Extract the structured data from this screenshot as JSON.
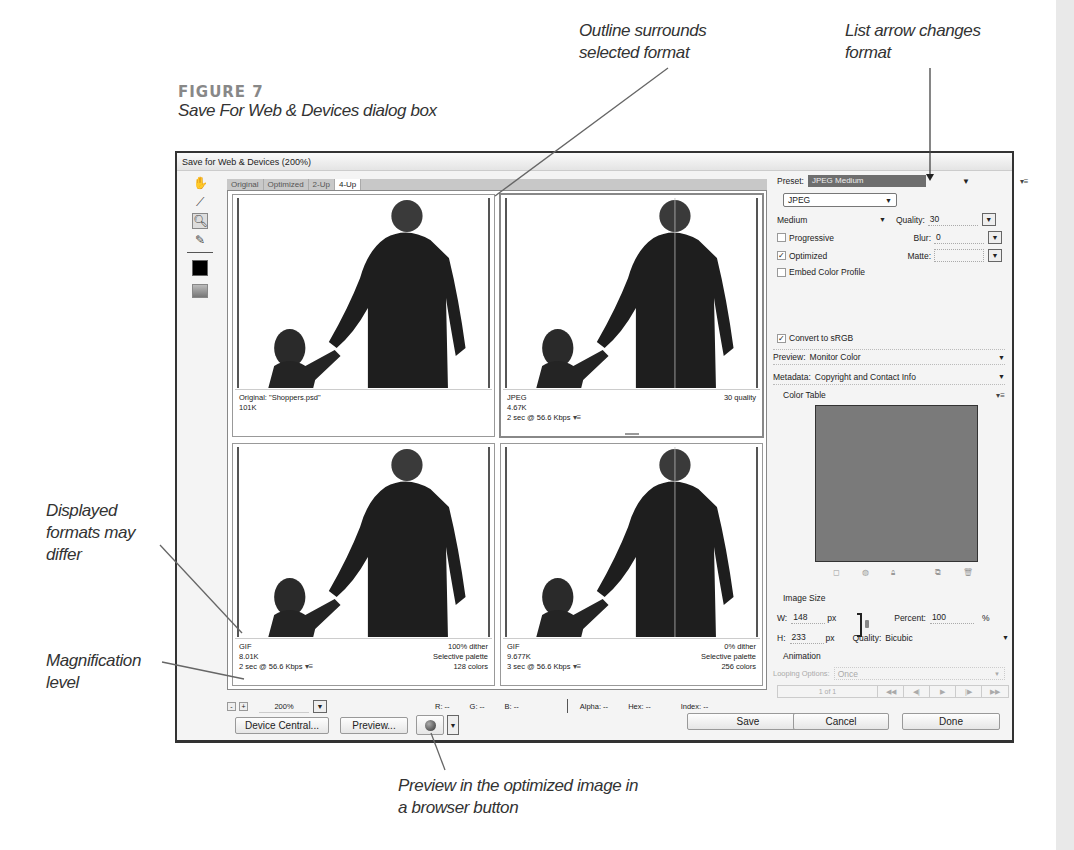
{
  "figure": {
    "label": "FIGURE 7",
    "caption": "Save For Web & Devices dialog box"
  },
  "callouts": {
    "outline": [
      "Outline surrounds",
      "selected format"
    ],
    "list_arrow": [
      "List arrow changes",
      "format"
    ],
    "displayed_formats": [
      "Displayed",
      "formats may",
      "differ"
    ],
    "magnification": [
      "Magnification",
      "level"
    ],
    "preview_browser": [
      "Preview in the optimized image in",
      "a browser button"
    ]
  },
  "dialog": {
    "title": "Save for Web & Devices (200%)",
    "tools": [
      "hand-tool",
      "slice-select-tool",
      "zoom-tool",
      "eyedropper-tool",
      "eyedropper-color",
      "toggle-slices-visibility"
    ],
    "tabs": [
      {
        "label": "Original",
        "active": false
      },
      {
        "label": "Optimized",
        "active": false
      },
      {
        "label": "2-Up",
        "active": false
      },
      {
        "label": "4-Up",
        "active": true
      }
    ],
    "panes": [
      {
        "format": "Original: \"Shoppers.psd\"",
        "size": "101K",
        "time": "",
        "right1": "",
        "right2": "",
        "right3": "",
        "selected": false
      },
      {
        "format": "JPEG",
        "size": "4.67K",
        "time": "2 sec @ 56.6 Kbps",
        "right1": "30 quality",
        "right2": "",
        "right3": "",
        "selected": true
      },
      {
        "format": "GIF",
        "size": "8.01K",
        "time": "2 sec @ 56.6 Kbps",
        "right1": "100% dither",
        "right2": "Selective palette",
        "right3": "128 colors",
        "selected": false
      },
      {
        "format": "GIF",
        "size": "9.677K",
        "time": "3 sec @ 56.6 Kbps",
        "right1": "0% dither",
        "right2": "Selective palette",
        "right3": "256 colors",
        "selected": false
      }
    ],
    "status": {
      "zoom_out": "-",
      "zoom_in": "+",
      "zoom_level": "200%",
      "r": "R: --",
      "g": "G: --",
      "b": "B: --",
      "alpha": "Alpha: --",
      "hex": "Hex: --",
      "index": "Index: --"
    },
    "buttons": {
      "device_central": "Device Central...",
      "preview": "Preview...",
      "save": "Save",
      "cancel": "Cancel",
      "done": "Done"
    },
    "settings": {
      "preset_label": "Preset:",
      "preset_value": "JPEG Medium",
      "format_value": "JPEG",
      "quality_preset": "Medium",
      "quality_label": "Quality:",
      "quality_value": "30",
      "progressive_label": "Progressive",
      "progressive_checked": false,
      "blur_label": "Blur:",
      "blur_value": "0",
      "optimized_label": "Optimized",
      "optimized_checked": true,
      "matte_label": "Matte:",
      "matte_value": "",
      "embed_label": "Embed Color Profile",
      "embed_checked": false,
      "srgb_label": "Convert to sRGB",
      "srgb_checked": true,
      "preview_label": "Preview:",
      "preview_value": "Monitor Color",
      "metadata_label": "Metadata:",
      "metadata_value": "Copyright and Contact Info",
      "color_table_label": "Color Table",
      "image_size_label": "Image Size",
      "w_label": "W:",
      "w_value": "148",
      "h_label": "H:",
      "h_value": "233",
      "px": "px",
      "percent_label": "Percent:",
      "percent_value": "100",
      "percent_unit": "%",
      "resample_label": "Quality:",
      "resample_value": "Bicubic",
      "animation_label": "Animation",
      "looping_label": "Looping Options:",
      "looping_value": "Once",
      "frame_counter": "1 of 1"
    },
    "colors": {
      "preset_bg": "#6e6e6e",
      "color_table_bg": "#7a7a7a"
    }
  }
}
